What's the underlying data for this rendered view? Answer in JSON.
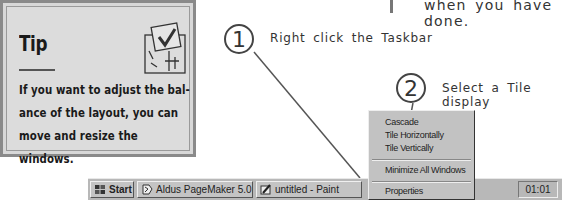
{
  "tip": {
    "title": "Tip",
    "body_lines": [
      "If you want to adjust the bal-",
      "ance of the layout, you can",
      "move and resize the windows."
    ],
    "icon": "checklist-icon"
  },
  "annotation_top": {
    "text": "when you have done."
  },
  "callouts": [
    {
      "number": "1",
      "text": "Right click the Taskbar"
    },
    {
      "number": "2",
      "text": "Select a Tile display"
    }
  ],
  "taskbar": {
    "start_label": "Start",
    "buttons": [
      {
        "label": "Aldus PageMaker 5.0",
        "icon": "pagemaker-icon"
      },
      {
        "label": "untitled - Paint",
        "icon": "paint-icon"
      }
    ],
    "clock": "01:01"
  },
  "context_menu": {
    "items": [
      {
        "label": "Cascade",
        "accel": "C"
      },
      {
        "label": "Tile Horizontally",
        "accel": "H"
      },
      {
        "label": "Tile Vertically",
        "accel": "V"
      },
      {
        "label": "Minimize All Windows",
        "accel": "M"
      },
      {
        "label": "Properties",
        "accel": "r"
      }
    ]
  },
  "colors": {
    "taskbar": "#b8b8b8",
    "tip_bg": "#dcdcdc",
    "callout_line": "#555555"
  }
}
